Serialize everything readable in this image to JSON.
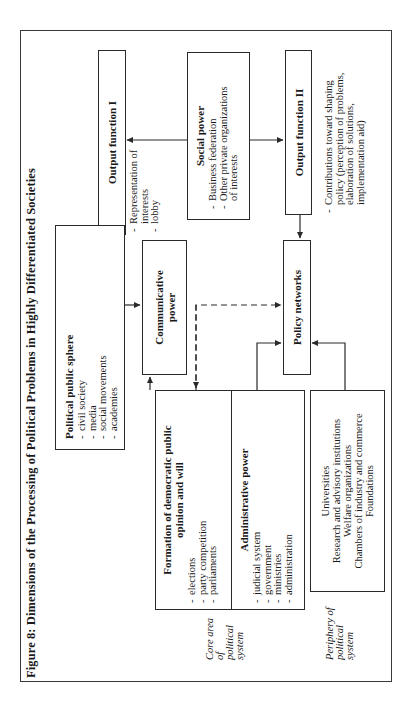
{
  "figure": {
    "title": "Figure 8: Dimensions of the Processing of Political Problems in Highly Differentiated Societies"
  },
  "output_function_1": {
    "title": "Output function I",
    "items": [
      "Representation of interests",
      "lobby"
    ]
  },
  "social_power": {
    "title": "Social power",
    "items": [
      "Business federation",
      "Other private organizations of interests"
    ]
  },
  "output_function_2": {
    "title": "Output function II",
    "items": [
      "Contributions toward shaping policy (perception of problems, elaboration of solutions, implementation aid)"
    ]
  },
  "political_public_sphere": {
    "title": "Political public sphere",
    "items": [
      "civil society",
      "media",
      "social movements",
      "academies"
    ]
  },
  "communicative_power": {
    "title_line1": "Communicative",
    "title_line2": "power"
  },
  "policy_networks": {
    "title": "Policy networks"
  },
  "formation": {
    "title_line1": "Formation of democratic public",
    "title_line2": "opinion and will",
    "items": [
      "elections",
      "party competition",
      "parliaments"
    ]
  },
  "administrative_power": {
    "title": "Administrative power",
    "items": [
      "judicial system",
      "government",
      "ministries",
      "administration"
    ]
  },
  "periphery_institutions": {
    "lines": [
      "Universities",
      "Research and advisory institutions",
      "Welfare organizations",
      "Chambers of industry and commerce",
      "Foundations"
    ]
  },
  "side_labels": {
    "core": [
      "Core area of",
      "political",
      "system"
    ],
    "periphery": [
      "Periphery of",
      "political",
      "system"
    ]
  },
  "colors": {
    "line": "#2a2a2a",
    "background": "#ffffff",
    "text": "#1a1a1a"
  }
}
